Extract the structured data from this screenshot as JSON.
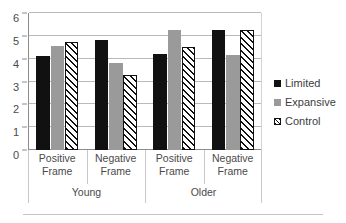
{
  "chart_data": {
    "type": "bar",
    "title": "",
    "xlabel": "",
    "ylabel": "",
    "ylim": [
      0,
      6
    ],
    "yticks": [
      0,
      1,
      2,
      3,
      4,
      5,
      6
    ],
    "grid": true,
    "legend_position": "right",
    "categories": [
      "Positive Frame",
      "Negative Frame",
      "Positive Frame",
      "Negative Frame"
    ],
    "group_labels": [
      "Young",
      "Older"
    ],
    "series": [
      {
        "name": "Limited",
        "color": "#111111",
        "values": [
          4.1,
          4.8,
          4.2,
          5.25
        ]
      },
      {
        "name": "Expansive",
        "color": "#9a9a9a",
        "values": [
          4.55,
          3.8,
          5.25,
          4.15
        ]
      },
      {
        "name": "Control",
        "color": "#ffffff",
        "pattern": "diagonal-hatch",
        "values": [
          4.75,
          3.3,
          4.5,
          5.25
        ]
      }
    ]
  },
  "axis": {
    "y_tick_labels": [
      "6",
      "5",
      "4",
      "3",
      "2",
      "1",
      "0"
    ]
  },
  "categories": [
    {
      "line1": "Positive",
      "line2": "Frame"
    },
    {
      "line1": "Negative",
      "line2": "Frame"
    },
    {
      "line1": "Positive",
      "line2": "Frame"
    },
    {
      "line1": "Negative",
      "line2": "Frame"
    }
  ],
  "groups": [
    {
      "label": "Young"
    },
    {
      "label": "Older"
    }
  ],
  "legend": {
    "items": [
      {
        "label": "Limited"
      },
      {
        "label": "Expansive"
      },
      {
        "label": "Control"
      }
    ]
  }
}
